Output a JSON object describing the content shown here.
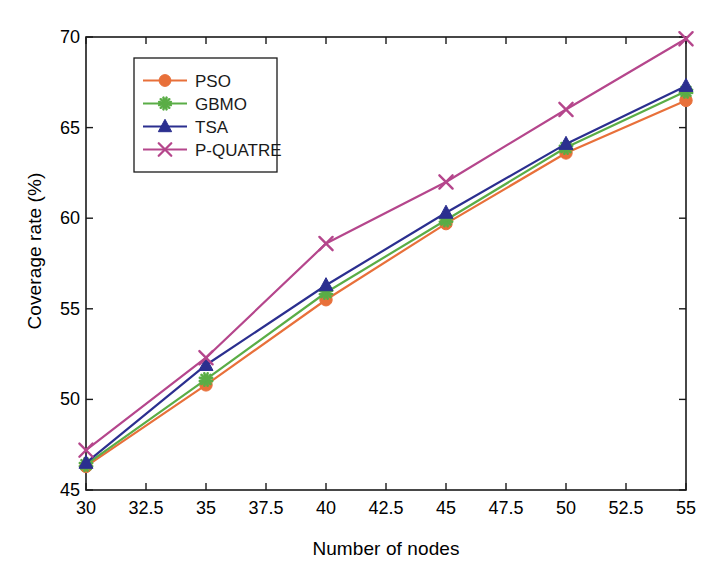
{
  "chart_data": {
    "type": "line",
    "title": "",
    "xlabel": "Number of nodes",
    "ylabel": "Coverage rate (%)",
    "x": [
      30,
      35,
      40,
      45,
      50,
      55
    ],
    "xlim": [
      30,
      55
    ],
    "ylim": [
      45,
      70
    ],
    "xticks": [
      30,
      32.5,
      35,
      37.5,
      40,
      42.5,
      45,
      47.5,
      50,
      52.5,
      55
    ],
    "yticks": [
      45,
      50,
      55,
      60,
      65,
      70
    ],
    "xtick_labels": [
      "30",
      "32.5",
      "35",
      "37.5",
      "40",
      "42.5",
      "45",
      "47.5",
      "50",
      "52.5",
      "55"
    ],
    "ytick_labels": [
      "45",
      "50",
      "55",
      "60",
      "65",
      "70"
    ],
    "grid": false,
    "legend_position": "upper left",
    "series": [
      {
        "name": "PSO",
        "color": "#e8703a",
        "marker": "circle",
        "values": [
          46.3,
          50.8,
          55.5,
          59.7,
          63.6,
          66.5
        ]
      },
      {
        "name": "GBMO",
        "color": "#5aad46",
        "marker": "star",
        "values": [
          46.4,
          51.1,
          55.9,
          59.9,
          63.9,
          67.0
        ]
      },
      {
        "name": "TSA",
        "color": "#2b2f8f",
        "marker": "triangle",
        "values": [
          46.5,
          51.9,
          56.3,
          60.3,
          64.1,
          67.3
        ]
      },
      {
        "name": "P-QUATRE",
        "color": "#b5468c",
        "marker": "x",
        "values": [
          47.2,
          52.3,
          58.6,
          62.0,
          66.0,
          69.9
        ]
      }
    ]
  },
  "axes": {
    "frame_color": "#1a1a1a"
  }
}
